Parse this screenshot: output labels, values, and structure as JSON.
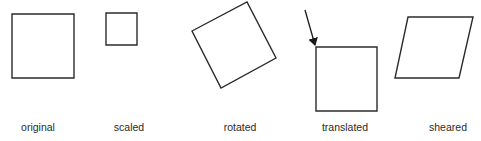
{
  "diagram": {
    "title": "",
    "stroke_color": "#2b2b2b",
    "panels": [
      {
        "id": "original",
        "label": "original",
        "shape": "square",
        "points": [
          [
            12,
            14
          ],
          [
            74,
            14
          ],
          [
            74,
            78
          ],
          [
            12,
            78
          ]
        ],
        "label_x": 38
      },
      {
        "id": "scaled",
        "label": "scaled",
        "shape": "square",
        "points": [
          [
            106,
            13
          ],
          [
            137,
            13
          ],
          [
            137,
            45
          ],
          [
            106,
            45
          ]
        ],
        "label_x": 129
      },
      {
        "id": "rotated",
        "label": "rotated",
        "shape": "square",
        "points": [
          [
            192,
            31
          ],
          [
            247,
            2
          ],
          [
            276,
            58
          ],
          [
            221,
            88
          ]
        ],
        "label_x": 240
      },
      {
        "id": "translated",
        "label": "translated",
        "shape": "square",
        "points": [
          [
            316,
            47
          ],
          [
            377,
            47
          ],
          [
            377,
            111
          ],
          [
            316,
            111
          ]
        ],
        "label_x": 345,
        "arrow": {
          "from": [
            305,
            10
          ],
          "to": [
            316,
            47
          ]
        }
      },
      {
        "id": "sheared",
        "label": "sheared",
        "shape": "parallelogram",
        "points": [
          [
            408,
            17
          ],
          [
            473,
            17
          ],
          [
            459,
            78
          ],
          [
            395,
            78
          ]
        ],
        "label_x": 448
      }
    ]
  }
}
